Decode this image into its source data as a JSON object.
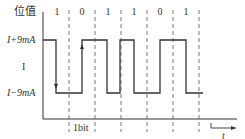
{
  "title": "位值",
  "y_labels": {
    "high": "I+9mA",
    "mid": "I",
    "low": "I−9mA"
  },
  "bits": [
    "1",
    "0",
    "1",
    "1",
    "0",
    "1"
  ],
  "bit_width_label": "1bit",
  "time_label": "t",
  "colors": {
    "line": "#333333",
    "dashed": "#555555",
    "background": "#ffffff"
  },
  "waveform": {
    "description": "Manchester-encoded current signal, levels I+9mA and I-9mA",
    "bit_boundaries_x": [
      69,
      95,
      121,
      147,
      173,
      199
    ]
  }
}
